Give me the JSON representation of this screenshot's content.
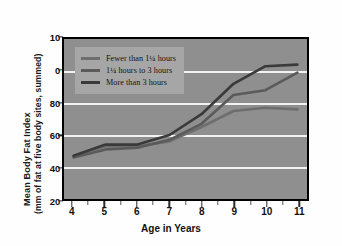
{
  "chart_data": {
    "type": "line",
    "title": "",
    "xlabel": "Age in Years",
    "ylabel_line1": "Mean Body Fat Index",
    "ylabel_line2": "(mm of fat at five body sites, summed)",
    "x": [
      4,
      5,
      6,
      7,
      8,
      9,
      10,
      11
    ],
    "xticklabels": [
      "4",
      "5",
      "6",
      "7",
      "8",
      "9",
      "10",
      "11"
    ],
    "xlim": [
      3.7,
      11.3
    ],
    "ylim": [
      20,
      120
    ],
    "yticks": [
      20,
      40,
      60,
      80,
      100,
      120
    ],
    "yticklabels": [
      "20",
      "40",
      "60",
      "80",
      "0",
      "10"
    ],
    "grid": "horizontal",
    "legend_position": "upper-left-inside",
    "plot_background": "#8f8f8f",
    "gridline_color": "#f2f2f2",
    "series": [
      {
        "name": "Fewer than 1¼ hours",
        "color": "#6e6e6e",
        "values": [
          47,
          53,
          53,
          56,
          65,
          75,
          77,
          76
        ]
      },
      {
        "name": "1¼ hours to 3 hours",
        "color": "#5a5a5a",
        "values": [
          46,
          51,
          52,
          57,
          67,
          85,
          88,
          99
        ]
      },
      {
        "name": "More than 3 hours",
        "color": "#3a3a3a",
        "values": [
          47,
          54,
          54,
          60,
          73,
          92,
          103,
          104
        ]
      }
    ]
  },
  "legend": {
    "items": [
      {
        "label": "Fewer than 1¼ hours",
        "color": "#6e6e6e"
      },
      {
        "label": "1¼ hours to 3 hours",
        "color": "#5a5a5a"
      },
      {
        "label": "More than 3 hours",
        "color": "#3a3a3a"
      }
    ]
  }
}
